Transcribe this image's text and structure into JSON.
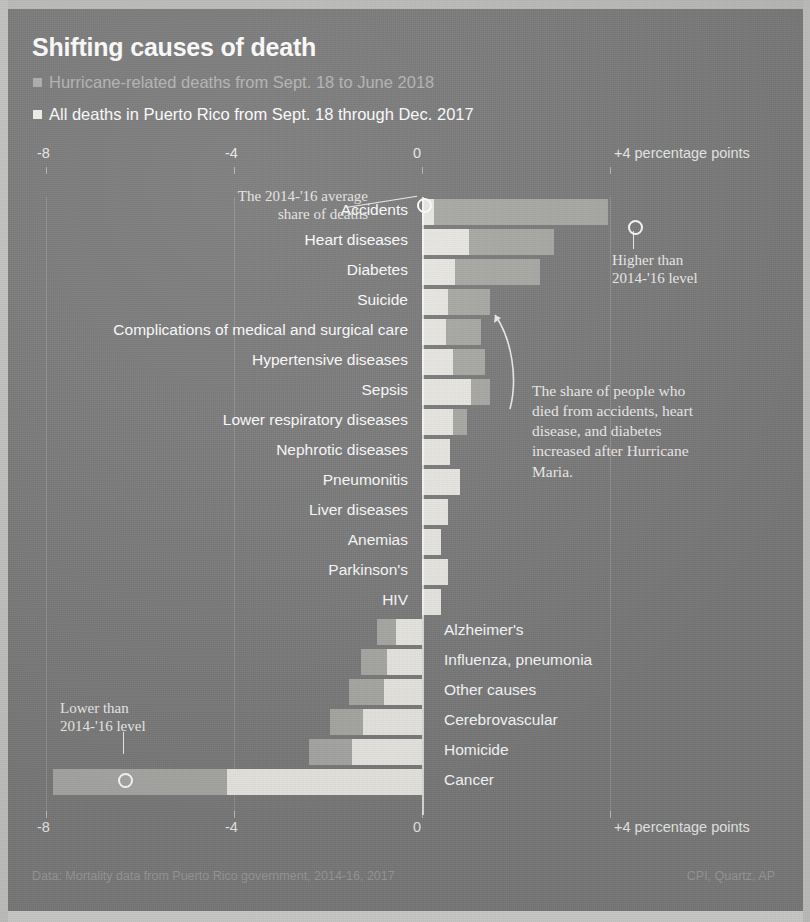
{
  "header": {
    "title": "Shifting causes of death",
    "legend": [
      {
        "label": "Hurricane-related deaths from Sept. 18 to June 2018",
        "color": "#d9d9d6",
        "name": "hurricane-related"
      },
      {
        "label": "All deaths in Puerto Rico from Sept. 18 through Dec. 2017",
        "color": "#f2f2ef",
        "name": "all-deaths"
      }
    ]
  },
  "axis": {
    "unit_label": "+4 percentage points",
    "ticks": [
      {
        "label": "-8",
        "value": -8
      },
      {
        "label": "-4",
        "value": -4
      },
      {
        "label": "0",
        "value": 0
      },
      {
        "label": "+4 percentage points",
        "value": 4
      }
    ]
  },
  "annotations": [
    {
      "id": "avg-share",
      "lines": [
        "The 2014-'16 average",
        "share of deaths"
      ],
      "name": "annotation-average-share"
    },
    {
      "id": "higher",
      "lines": [
        "Higher than",
        "2014-'16 level"
      ],
      "name": "annotation-higher-than"
    },
    {
      "id": "lower",
      "lines": [
        "Lower than",
        "2014-'16 level"
      ],
      "name": "annotation-lower-than"
    },
    {
      "id": "share-increase",
      "lines": [
        "The share of people who",
        "died from accidents, heart",
        "disease, and diabetes",
        "increased after Hurricane",
        "Maria."
      ],
      "name": "annotation-share-increase"
    }
  ],
  "footer": {
    "data_note": "Data: Mortality data from Puerto Rico government, 2014-16, 2017",
    "credit": "CPI, Quartz, AP"
  },
  "chart_data": {
    "type": "bar",
    "title": "Shifting causes of death",
    "xlabel": "+4 percentage points",
    "ylabel": "",
    "xlim": [
      -9,
      5
    ],
    "grid": true,
    "legend_position": "top-left",
    "orientation": "horizontal-diverging",
    "categories": [
      "Accidents",
      "Heart diseases",
      "Diabetes",
      "Suicide",
      "Complications of medical and surgical care",
      "Hypertensive diseases",
      "Sepsis",
      "Lower respiratory diseases",
      "Nephrotic diseases",
      "Pneumonitis",
      "Liver diseases",
      "Anemias",
      "Parkinson's",
      "HIV",
      "Alzheimer's",
      "Influenza, pneumonia",
      "Other causes",
      "Cerebrovascular",
      "Homicide",
      "Cancer"
    ],
    "label_side": [
      "left",
      "left",
      "left",
      "left",
      "left",
      "left",
      "left",
      "left",
      "left",
      "left",
      "left",
      "left",
      "left",
      "left",
      "right",
      "right",
      "right",
      "right",
      "right",
      "right"
    ],
    "series": [
      {
        "name": "Hurricane-related deaths from Sept. 18 to June 2018",
        "color": "#a9a9a6",
        "values": [
          3.95,
          2.8,
          2.5,
          1.45,
          1.25,
          1.35,
          1.45,
          0.95,
          0.3,
          0.55,
          0.35,
          0.25,
          0.35,
          0.0,
          -0.95,
          -1.3,
          -1.55,
          -1.95,
          -2.4,
          -7.85
        ]
      },
      {
        "name": "All deaths in Puerto Rico from Sept. 18 through Dec. 2017",
        "color": "#eceae5",
        "values": [
          0.25,
          1.0,
          0.7,
          0.55,
          0.5,
          0.65,
          1.05,
          0.65,
          0.6,
          0.8,
          0.55,
          0.4,
          0.55,
          0.4,
          -0.55,
          -0.75,
          -0.8,
          -1.25,
          -1.5,
          -4.15
        ]
      }
    ]
  }
}
